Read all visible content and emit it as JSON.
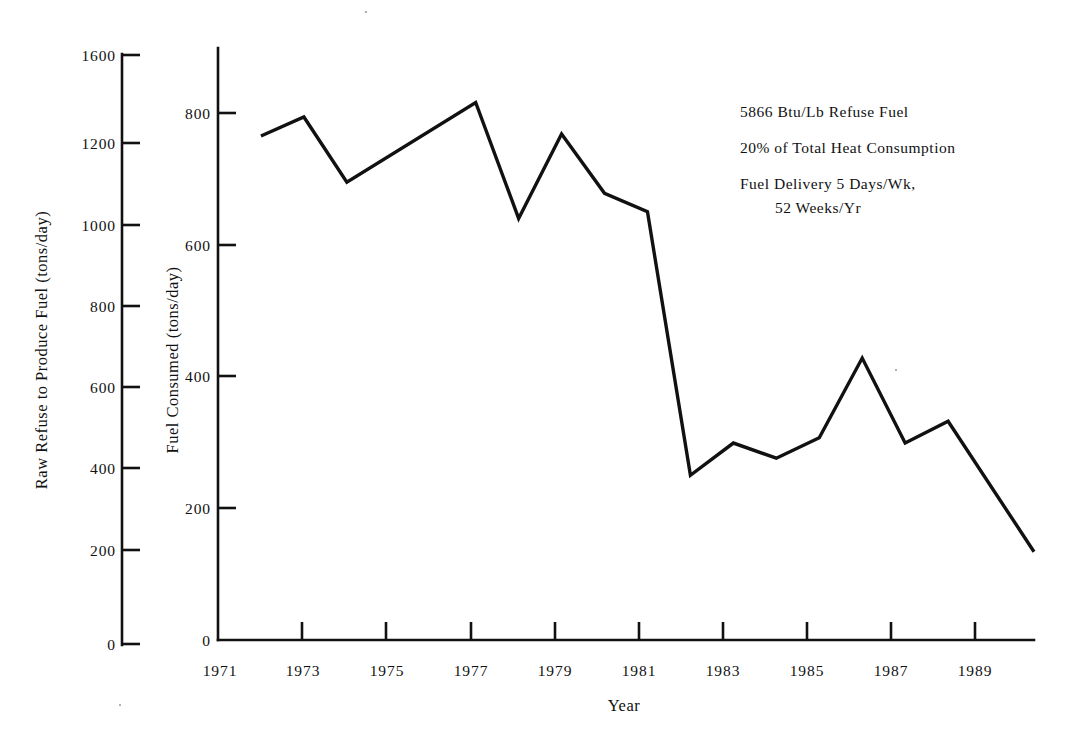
{
  "chart_data": {
    "type": "line",
    "title": "",
    "xlabel": "Year",
    "ylabel": "Fuel Consumed (tons/day)",
    "secondary_ylabel": "Raw Refuse to Produce Fuel (tons/day)",
    "grid": false,
    "legend": "none",
    "xlim": [
      1971,
      1990
    ],
    "ylim": [
      0,
      800
    ],
    "secondary_ylim": [
      0,
      1600
    ],
    "x_tick_labels": [
      "1971",
      "1973",
      "1975",
      "1977",
      "1979",
      "1981",
      "1983",
      "1985",
      "1987",
      "1989"
    ],
    "x_ticks": [
      1971,
      1973,
      1975,
      1977,
      1979,
      1981,
      1983,
      1985,
      1987,
      1989
    ],
    "y_tick_labels": [
      "0",
      "200",
      "400",
      "600",
      "800"
    ],
    "y_ticks": [
      0,
      200,
      400,
      600,
      800
    ],
    "secondary_y_tick_labels": [
      "0",
      "200",
      "400",
      "600",
      "800",
      "1000",
      "1200",
      "1600"
    ],
    "secondary_y_ticks": [
      0,
      200,
      400,
      600,
      800,
      1000,
      1200,
      1600
    ],
    "series": [
      {
        "name": "Fuel Consumed",
        "x": [
          1972,
          1973,
          1974,
          1977,
          1978,
          1979,
          1980,
          1981,
          1982,
          1983,
          1984,
          1985,
          1986,
          1987,
          1988,
          1990
        ],
        "values": [
          765,
          794,
          695,
          816,
          640,
          768,
          678,
          650,
          250,
          299,
          276,
          307,
          428,
          299,
          332,
          134
        ]
      }
    ],
    "annotations": [
      "5866 Btu/Lb Refuse Fuel",
      "20% of Total Heat Consumption",
      "Fuel Delivery 5 Days/Wk,",
      "52 Weeks/Yr"
    ]
  },
  "axes": {
    "left_axis_title": "Raw Refuse to Produce Fuel (tons/day)",
    "main_axis_title": "Fuel Consumed (tons/day)",
    "x_axis_title": "Year",
    "left_tick_labels": [
      "1600",
      "1200",
      "1000",
      "800",
      "600",
      "400",
      "200",
      "0"
    ],
    "main_tick_labels": [
      "800",
      "600",
      "400",
      "200",
      "0"
    ],
    "x_tick_labels": [
      "1971",
      "1973",
      "1975",
      "1977",
      "1979",
      "1981",
      "1983",
      "1985",
      "1987",
      "1989"
    ]
  },
  "annotation_block": {
    "line1": "5866 Btu/Lb Refuse Fuel",
    "line2": "20% of Total Heat Consumption",
    "line3": "Fuel Delivery 5 Days/Wk,",
    "line4": "52 Weeks/Yr"
  },
  "colors": {
    "ink": "#111111",
    "paper": "#ffffff"
  }
}
